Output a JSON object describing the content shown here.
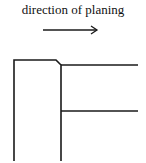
{
  "caption": "direction of planing",
  "arrow": {
    "x1": 43,
    "x2": 97,
    "y": 30,
    "direction": "right"
  },
  "colors": {
    "ink": "#1a1a1a",
    "background": "#ffffff"
  },
  "tool_outline": {
    "left_edge_x": 14,
    "top_y": 60,
    "chamfer_start_x": 56,
    "chamfer_end": [
      61,
      65
    ],
    "right_edge_x": 61,
    "bottom_y": 161
  },
  "workpiece_lines": {
    "upper_surface_y": 65,
    "lower_surface_y": 111,
    "end_x": 138
  }
}
